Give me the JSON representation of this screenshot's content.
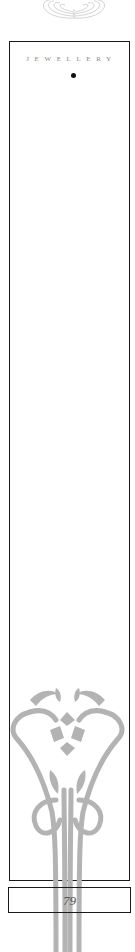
{
  "page": {
    "section_title": "JEWELLERY",
    "page_number": "79"
  },
  "colors": {
    "frame": "#1a1a1a",
    "title_text": "#8a8a8a",
    "ornament": "#b3b3b3",
    "ornament_top": "#c8c8c8",
    "bullet": "#111111"
  },
  "icons": {
    "top_ornament": "swirl-ornament",
    "bottom_ornament": "art-nouveau-floral-ornament",
    "title_bullet": "bullet-dot"
  }
}
